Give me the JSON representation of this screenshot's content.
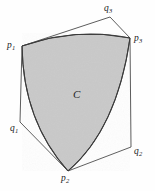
{
  "figure": {
    "kind": "reuleaux-like-convex-region-with-circumscribed-polygon",
    "background_color": "#fefefe",
    "region": {
      "label": "C",
      "fill_color": "#c9c9c9",
      "stroke_color": "#3a3a3a",
      "stroke_width": 1.1,
      "label_position": {
        "x": 74,
        "y": 90
      }
    },
    "polygon": {
      "stroke_color": "#4a4a4a",
      "stroke_width": 0.9,
      "fill": "none"
    },
    "points": [
      {
        "id": "p1",
        "label": "p",
        "subscript": "1",
        "x": 22,
        "y": 46,
        "label_x": 7,
        "label_y": 41,
        "type": "contact"
      },
      {
        "id": "q3",
        "label": "q",
        "subscript": "3",
        "x": 110,
        "y": 17,
        "label_x": 104,
        "label_y": 5,
        "type": "corner"
      },
      {
        "id": "p3",
        "label": "p",
        "subscript": "3",
        "x": 130,
        "y": 38,
        "label_x": 134,
        "label_y": 35,
        "type": "contact"
      },
      {
        "id": "q2",
        "label": "q",
        "subscript": "2",
        "x": 131,
        "y": 147,
        "label_x": 134,
        "label_y": 148,
        "type": "corner"
      },
      {
        "id": "p2",
        "label": "p",
        "subscript": "2",
        "x": 68,
        "y": 171,
        "label_x": 61,
        "label_y": 174,
        "type": "contact"
      },
      {
        "id": "q1",
        "label": "q",
        "subscript": "1",
        "x": 20,
        "y": 122,
        "label_x": 10,
        "label_y": 125,
        "type": "corner"
      }
    ],
    "arcs": [
      {
        "from": "p1",
        "to": "p3",
        "bulge": "outward-up",
        "control": {
          "x": 76,
          "y": 27
        }
      },
      {
        "from": "p3",
        "to": "p2",
        "bulge": "outward-right",
        "control": {
          "x": 117,
          "y": 129
        }
      },
      {
        "from": "p2",
        "to": "p1",
        "bulge": "outward-left",
        "control": {
          "x": 23,
          "y": 121
        }
      }
    ],
    "polygon_edges": [
      {
        "from": "p1",
        "to": "q3"
      },
      {
        "from": "q3",
        "to": "p3"
      },
      {
        "from": "p3",
        "to": "q2"
      },
      {
        "from": "q2",
        "to": "p2"
      },
      {
        "from": "p2",
        "to": "q1"
      },
      {
        "from": "q1",
        "to": "p1"
      }
    ]
  }
}
